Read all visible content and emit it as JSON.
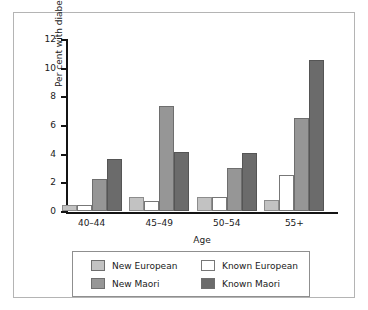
{
  "chart_data": {
    "type": "bar",
    "title": "",
    "xlabel": "Age",
    "ylabel": "Per cent with diabetes",
    "ylim": [
      0,
      12
    ],
    "yticks": [
      0,
      2,
      4,
      6,
      8,
      10,
      12
    ],
    "ytick_labels": [
      "0",
      "2",
      "4",
      "6",
      "8",
      "10",
      "12"
    ],
    "grid": false,
    "legend_position": "below-axes",
    "categories": [
      "40–44",
      "45–49",
      "50–54",
      "55+"
    ],
    "series": [
      {
        "name": "New European",
        "color": "#c2c2c2",
        "values": [
          0.4,
          1.0,
          1.0,
          0.8
        ]
      },
      {
        "name": "Known European",
        "color": "#ffffff",
        "values": [
          0.4,
          0.7,
          1.0,
          2.5
        ]
      },
      {
        "name": "New Maori",
        "color": "#969696",
        "values": [
          2.25,
          7.3,
          3.0,
          6.5
        ]
      },
      {
        "name": "Known Maori",
        "color": "#6b6b6b",
        "values": [
          3.6,
          4.1,
          4.05,
          10.55
        ]
      }
    ]
  },
  "legend": {
    "entries": [
      {
        "label": "New European",
        "swatch": "#c2c2c2"
      },
      {
        "label": "Known European",
        "swatch": "#ffffff"
      },
      {
        "label": "New Maori",
        "swatch": "#969696"
      },
      {
        "label": "Known Maori",
        "swatch": "#6b6b6b"
      }
    ]
  }
}
